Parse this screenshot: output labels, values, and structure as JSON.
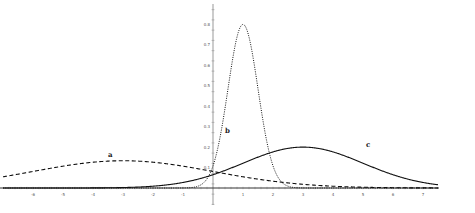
{
  "chart_data": {
    "type": "line",
    "title": "",
    "xlabel": "",
    "ylabel": "",
    "xlim": [
      -7,
      8
    ],
    "ylim": [
      -0.1,
      0.9
    ],
    "grid": false,
    "legend": "none (curves labeled inline)",
    "x_ticks": [
      -6,
      -5,
      -4,
      -3,
      -2,
      -1,
      1,
      2,
      3,
      4,
      5,
      6,
      7
    ],
    "y_ticks": [
      0.1,
      0.2,
      0.3,
      0.4,
      0.5,
      0.6,
      0.7,
      0.8
    ],
    "series": [
      {
        "name": "a",
        "style": "dashed",
        "distribution": "normal",
        "mean": -3,
        "sd": 3,
        "peak": 0.133
      },
      {
        "name": "b",
        "style": "dotted",
        "distribution": "normal",
        "mean": 1,
        "sd": 0.5,
        "peak": 0.798
      },
      {
        "name": "c",
        "style": "solid",
        "distribution": "normal",
        "mean": 3,
        "sd": 2,
        "peak": 0.199
      }
    ],
    "annotations": [
      {
        "text": "a",
        "x": -3.5,
        "y": 0.15
      },
      {
        "text": "b",
        "x": 0.4,
        "y": 0.27
      },
      {
        "text": "c",
        "x": 5.1,
        "y": 0.2
      }
    ]
  },
  "labels": {
    "a": "a",
    "b": "b",
    "c": "c"
  },
  "colors": {
    "curves": "#111111",
    "axis": "#333333",
    "background": "#ffffff"
  }
}
